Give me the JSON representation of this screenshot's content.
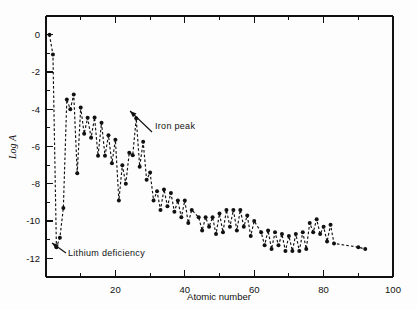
{
  "figure": {
    "name": "cosmic-abundance-plot",
    "background": "#fdfdfd",
    "ink_color": "#111111"
  },
  "chart_data": {
    "type": "line",
    "title": "",
    "subtitle": "",
    "xlabel": "Atomic number",
    "ylabel": "Log A",
    "xlim": [
      0,
      100
    ],
    "ylim": [
      -13,
      1
    ],
    "grid": false,
    "legend": null,
    "x_ticks": [
      20,
      40,
      60,
      80,
      100
    ],
    "x_tick_labels": [
      "20",
      "40",
      "60",
      "80",
      "100"
    ],
    "x_minor_tick_step": 10,
    "y_ticks": [
      0,
      -2,
      -4,
      -6,
      -8,
      -10,
      -12
    ],
    "y_tick_labels": [
      "0",
      "-2",
      "-4",
      "-6",
      "-8",
      "-10",
      "-12"
    ],
    "y_minor_tick_step": 1,
    "marker": "filled-circle",
    "line_style": "dashed",
    "series": [
      {
        "name": "Solar system elemental abundance",
        "x": [
          1,
          2,
          3,
          4,
          5,
          6,
          7,
          8,
          9,
          10,
          11,
          12,
          13,
          14,
          15,
          16,
          17,
          18,
          19,
          20,
          21,
          22,
          23,
          24,
          25,
          26,
          27,
          28,
          29,
          30,
          31,
          32,
          33,
          34,
          35,
          36,
          37,
          38,
          39,
          40,
          41,
          42,
          44,
          45,
          46,
          47,
          48,
          49,
          50,
          51,
          52,
          53,
          54,
          55,
          56,
          57,
          58,
          59,
          60,
          62,
          63,
          64,
          65,
          66,
          67,
          68,
          69,
          70,
          71,
          72,
          73,
          74,
          75,
          76,
          77,
          78,
          79,
          80,
          81,
          82,
          83,
          90,
          92
        ],
        "y": [
          0.0,
          -1.07,
          -11.4,
          -10.9,
          -9.3,
          -3.48,
          -4.0,
          -3.21,
          -7.44,
          -3.91,
          -5.31,
          -4.46,
          -5.53,
          -4.45,
          -6.5,
          -4.73,
          -6.5,
          -5.4,
          -6.9,
          -5.64,
          -8.9,
          -7.0,
          -8.0,
          -6.33,
          -6.47,
          -4.49,
          -7.08,
          -5.75,
          -7.79,
          -7.4,
          -8.9,
          -8.4,
          -9.4,
          -8.3,
          -9.2,
          -8.5,
          -9.5,
          -8.9,
          -9.8,
          -8.9,
          -10.1,
          -9.4,
          -9.8,
          -10.5,
          -9.8,
          -10.3,
          -9.8,
          -10.7,
          -9.6,
          -10.6,
          -9.4,
          -10.3,
          -9.4,
          -10.5,
          -9.4,
          -10.3,
          -9.7,
          -10.8,
          -10.0,
          -10.6,
          -11.3,
          -10.5,
          -11.5,
          -10.6,
          -11.3,
          -10.7,
          -11.6,
          -10.8,
          -11.6,
          -10.7,
          -11.6,
          -10.6,
          -11.5,
          -10.1,
          -10.6,
          -9.9,
          -10.7,
          -10.3,
          -11.1,
          -10.2,
          -11.2,
          -11.4,
          -11.5
        ],
        "color": "#111111"
      }
    ],
    "annotations": [
      {
        "id": "iron-peak",
        "label": "Iron peak",
        "text_x": 155,
        "text_y": 129,
        "arrow_from_x": 152,
        "arrow_from_y": 132,
        "arrow_to_x": 130,
        "arrow_to_y": 111
      },
      {
        "id": "lithium-deficiency",
        "label": "Lithium deficiency",
        "text_x": 68,
        "text_y": 256,
        "arrow_from_x": 66,
        "arrow_from_y": 253,
        "arrow_to_x": 52,
        "arrow_to_y": 243
      }
    ]
  }
}
